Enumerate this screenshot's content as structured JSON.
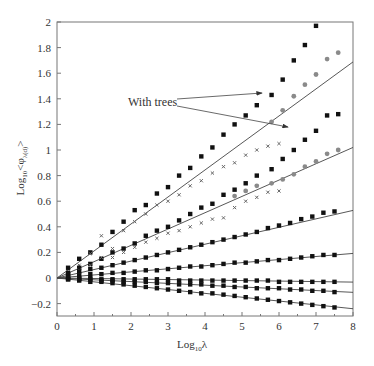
{
  "chart_data": {
    "type": "scatter",
    "title": "",
    "xlabel": "Log10 λ",
    "ylabel": "Log10 <φλ(d)>",
    "xlim": [
      0,
      8
    ],
    "ylim": [
      -0.3,
      2
    ],
    "grid": false,
    "legend": null,
    "x_ticks": [
      0,
      1,
      2,
      3,
      4,
      5,
      6,
      7,
      8
    ],
    "y_ticks": [
      -0.2,
      0,
      0.2,
      0.4,
      0.6,
      0.8,
      1,
      1.2,
      1.4,
      1.6,
      1.8,
      2
    ],
    "annotations": [
      {
        "text": "With trees",
        "x": 2.0,
        "y": 1.37,
        "arrows_to": [
          [
            5.5,
            1.44
          ],
          [
            6.2,
            1.19
          ]
        ]
      }
    ],
    "fit_lines": [
      {
        "name": "line-1",
        "slope": 0.211,
        "intercept": 0
      },
      {
        "name": "line-2",
        "slope": 0.1275,
        "intercept": 0
      },
      {
        "name": "line-3",
        "slope": 0.066,
        "intercept": 0
      },
      {
        "name": "line-4",
        "slope": 0.024,
        "intercept": 0
      },
      {
        "name": "line-5",
        "slope": -0.004,
        "intercept": 0
      },
      {
        "name": "line-6",
        "slope": -0.014,
        "intercept": 0
      },
      {
        "name": "line-7",
        "slope": -0.03,
        "intercept": 0
      }
    ],
    "series": [
      {
        "name": "set-1 with trees (black)",
        "marker": "square",
        "color": "#111111",
        "x": [
          0.3,
          0.6,
          0.9,
          1.2,
          1.5,
          1.8,
          2.1,
          2.4,
          2.7,
          3.0,
          3.3,
          3.6,
          3.9,
          4.2,
          4.5,
          4.8,
          5.1,
          5.4,
          5.8,
          6.1,
          6.4,
          6.7,
          7.0
        ],
        "y": [
          0.08,
          0.15,
          0.2,
          0.26,
          0.36,
          0.44,
          0.53,
          0.57,
          0.66,
          0.71,
          0.8,
          0.86,
          0.95,
          1.02,
          1.12,
          1.2,
          1.27,
          1.35,
          1.43,
          1.55,
          1.7,
          1.82,
          1.97
        ]
      },
      {
        "name": "set-1 with trees (gray)",
        "marker": "circle",
        "color": "#8a8a8a",
        "x": [
          5.8,
          6.1,
          6.4,
          6.7,
          7.0,
          7.3,
          7.6
        ],
        "y": [
          1.22,
          1.31,
          1.42,
          1.51,
          1.59,
          1.71,
          1.76
        ]
      },
      {
        "name": "set-1 without trees",
        "marker": "x",
        "color": "#666666",
        "x": [
          0.3,
          0.6,
          0.9,
          1.2,
          1.5,
          1.8,
          2.1,
          2.4,
          2.7,
          3.0,
          3.3,
          3.6,
          3.9,
          4.2,
          4.5,
          4.8,
          5.1,
          5.4,
          5.7,
          6.0
        ],
        "y": [
          0.05,
          0.1,
          0.19,
          0.33,
          0.23,
          0.37,
          0.44,
          0.5,
          0.57,
          0.6,
          0.65,
          0.72,
          0.76,
          0.82,
          0.87,
          0.9,
          0.96,
          1.0,
          1.03,
          1.05
        ]
      },
      {
        "name": "set-2 with trees (black)",
        "marker": "square",
        "color": "#111111",
        "x": [
          0.3,
          0.6,
          0.9,
          1.2,
          1.5,
          1.8,
          2.1,
          2.4,
          2.7,
          3.0,
          3.3,
          3.6,
          3.9,
          4.2,
          4.5,
          4.8,
          5.1,
          5.4,
          5.8,
          6.1,
          6.4,
          6.7,
          7.0,
          7.3,
          7.6
        ],
        "y": [
          0.04,
          0.08,
          0.11,
          0.15,
          0.2,
          0.23,
          0.27,
          0.33,
          0.37,
          0.4,
          0.45,
          0.5,
          0.55,
          0.58,
          0.65,
          0.69,
          0.74,
          0.8,
          0.85,
          0.93,
          1.0,
          1.08,
          1.15,
          1.27,
          1.28
        ]
      },
      {
        "name": "set-2 with trees (gray)",
        "marker": "circle",
        "color": "#8a8a8a",
        "x": [
          4.8,
          5.1,
          5.4,
          5.8,
          6.1,
          6.4,
          6.7,
          7.0,
          7.3,
          7.6
        ],
        "y": [
          0.64,
          0.68,
          0.72,
          0.74,
          0.77,
          0.81,
          0.87,
          0.91,
          0.97,
          1.0
        ]
      },
      {
        "name": "set-2 without trees",
        "marker": "x",
        "color": "#666666",
        "x": [
          0.3,
          0.6,
          0.9,
          1.2,
          1.5,
          1.8,
          2.1,
          2.4,
          2.7,
          3.0,
          3.3,
          3.6,
          3.9,
          4.2,
          4.5,
          4.8,
          5.1,
          5.4,
          5.7,
          6.0
        ],
        "y": [
          0.03,
          0.06,
          0.1,
          0.16,
          0.16,
          0.2,
          0.24,
          0.28,
          0.31,
          0.35,
          0.37,
          0.4,
          0.43,
          0.46,
          0.47,
          0.55,
          0.6,
          0.63,
          0.67,
          0.68
        ]
      },
      {
        "name": "set-3",
        "marker": "square",
        "color": "#111111",
        "x": [
          0.3,
          0.6,
          0.9,
          1.2,
          1.5,
          1.8,
          2.1,
          2.4,
          2.7,
          3.0,
          3.3,
          3.6,
          3.9,
          4.2,
          4.5,
          4.8,
          5.1,
          5.4,
          5.7,
          6.0,
          6.3,
          6.6,
          6.9,
          7.2,
          7.5
        ],
        "y": [
          0.03,
          0.05,
          0.07,
          0.08,
          0.1,
          0.12,
          0.14,
          0.16,
          0.18,
          0.2,
          0.22,
          0.24,
          0.26,
          0.28,
          0.3,
          0.32,
          0.34,
          0.36,
          0.39,
          0.41,
          0.43,
          0.46,
          0.48,
          0.51,
          0.52
        ]
      },
      {
        "name": "set-4",
        "marker": "square",
        "color": "#111111",
        "x": [
          0.3,
          0.6,
          0.9,
          1.2,
          1.5,
          1.8,
          2.1,
          2.4,
          2.7,
          3.0,
          3.3,
          3.6,
          3.9,
          4.2,
          4.5,
          4.8,
          5.1,
          5.4,
          5.7,
          6.0,
          6.3,
          6.6,
          6.9,
          7.2,
          7.5
        ],
        "y": [
          0.01,
          0.02,
          0.03,
          0.03,
          0.04,
          0.04,
          0.05,
          0.06,
          0.06,
          0.07,
          0.08,
          0.09,
          0.09,
          0.1,
          0.11,
          0.12,
          0.12,
          0.13,
          0.14,
          0.14,
          0.15,
          0.16,
          0.17,
          0.18,
          0.18
        ]
      },
      {
        "name": "set-5",
        "marker": "square",
        "color": "#111111",
        "x": [
          0.3,
          0.6,
          0.9,
          1.2,
          1.5,
          1.8,
          2.1,
          2.4,
          2.7,
          3.0,
          3.3,
          3.6,
          3.9,
          4.2,
          4.5,
          4.8,
          5.1,
          5.4,
          5.7,
          6.0,
          6.3,
          6.6,
          6.9,
          7.2,
          7.5
        ],
        "y": [
          0.0,
          0.0,
          0.0,
          -0.01,
          -0.01,
          -0.01,
          -0.01,
          -0.01,
          -0.01,
          -0.01,
          -0.02,
          -0.02,
          -0.02,
          -0.02,
          -0.02,
          -0.02,
          -0.02,
          -0.02,
          -0.02,
          -0.03,
          -0.03,
          -0.03,
          -0.03,
          -0.03,
          -0.03
        ]
      },
      {
        "name": "set-6",
        "marker": "square",
        "color": "#111111",
        "x": [
          0.3,
          0.6,
          0.9,
          1.2,
          1.5,
          1.8,
          2.1,
          2.4,
          2.7,
          3.0,
          3.3,
          3.6,
          3.9,
          4.2,
          4.5,
          4.8,
          5.1,
          5.4,
          5.7,
          6.0,
          6.3,
          6.6,
          6.9,
          7.2,
          7.5
        ],
        "y": [
          -0.01,
          -0.01,
          -0.01,
          -0.02,
          -0.02,
          -0.03,
          -0.03,
          -0.03,
          -0.04,
          -0.04,
          -0.05,
          -0.05,
          -0.05,
          -0.06,
          -0.06,
          -0.07,
          -0.07,
          -0.08,
          -0.08,
          -0.08,
          -0.09,
          -0.09,
          -0.1,
          -0.1,
          -0.11
        ]
      },
      {
        "name": "set-7",
        "marker": "square",
        "color": "#111111",
        "x": [
          0.3,
          0.6,
          0.9,
          1.2,
          1.5,
          1.8,
          2.1,
          2.4,
          2.7,
          3.0,
          3.3,
          3.6,
          3.9,
          4.2,
          4.5,
          4.8,
          5.1,
          5.4,
          5.7,
          6.0,
          6.3,
          6.6,
          6.9,
          7.2,
          7.5
        ],
        "y": [
          -0.01,
          -0.02,
          -0.03,
          -0.03,
          -0.04,
          -0.05,
          -0.06,
          -0.07,
          -0.08,
          -0.09,
          -0.1,
          -0.11,
          -0.12,
          -0.12,
          -0.13,
          -0.14,
          -0.15,
          -0.16,
          -0.17,
          -0.18,
          -0.19,
          -0.2,
          -0.21,
          -0.22,
          -0.23
        ]
      }
    ]
  },
  "labels": {
    "xlabel_main": "Log",
    "xlabel_sub": "10",
    "xlabel_tail": "λ",
    "ylabel_main": "Log",
    "ylabel_sub": "10",
    "ylabel_tail": "<φ",
    "ylabel_sub2": "λ(d)",
    "ylabel_close": ">",
    "annotation": "With trees"
  }
}
